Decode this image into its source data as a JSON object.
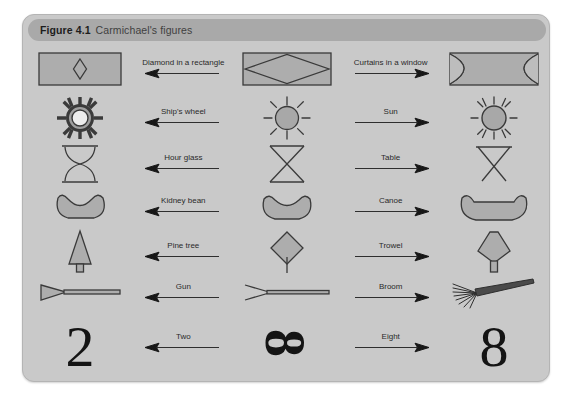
{
  "header": {
    "number": "Figure 4.1",
    "title": "Carmichael's figures"
  },
  "columns": {
    "left_label": "Word List I reproduction",
    "middle_label": "Stimulus figure",
    "right_label": "Word List II reproduction"
  },
  "rows": [
    {
      "left_word": "Diamond in a rectangle",
      "left_direction": "left",
      "right_word": "Curtains in a window",
      "right_direction": "right",
      "left_figure": "diamond-in-rectangle",
      "middle_figure": "ambiguous-rectangle-with-lens",
      "right_figure": "curtains-in-window"
    },
    {
      "left_word": "Ship's wheel",
      "left_direction": "left",
      "right_word": "Sun",
      "right_direction": "right",
      "left_figure": "ships-wheel",
      "middle_figure": "ambiguous-spoked-circle",
      "right_figure": "sun"
    },
    {
      "left_word": "Hour glass",
      "left_direction": "left",
      "right_word": "Table",
      "right_direction": "right",
      "left_figure": "hour-glass",
      "middle_figure": "ambiguous-crossed-lines",
      "right_figure": "table"
    },
    {
      "left_word": "Kidney bean",
      "left_direction": "left",
      "right_word": "Canoe",
      "right_direction": "right",
      "left_figure": "kidney-bean",
      "middle_figure": "ambiguous-crescent",
      "right_figure": "canoe"
    },
    {
      "left_word": "Pine tree",
      "left_direction": "left",
      "right_word": "Trowel",
      "right_direction": "right",
      "left_figure": "pine-tree",
      "middle_figure": "ambiguous-diamond-with-stem",
      "right_figure": "trowel"
    },
    {
      "left_word": "Gun",
      "left_direction": "left",
      "right_word": "Broom",
      "right_direction": "right",
      "left_figure": "gun",
      "middle_figure": "ambiguous-arrow-line",
      "right_figure": "broom"
    },
    {
      "left_word": "Two",
      "left_direction": "left",
      "right_word": "Eight",
      "right_direction": "right",
      "left_figure": "numeral-two",
      "middle_figure": "ambiguous-numeral",
      "right_figure": "numeral-eight"
    }
  ],
  "glyphs": {
    "two": "2",
    "eight": "8",
    "ambiguous_numeral": "8"
  },
  "colors": {
    "panel_background": "#c9c9c9",
    "header_background": "#a9a9a9",
    "figure_fill": "#adadad",
    "stroke": "#3a3a3a",
    "text": "#2a2a2a"
  }
}
